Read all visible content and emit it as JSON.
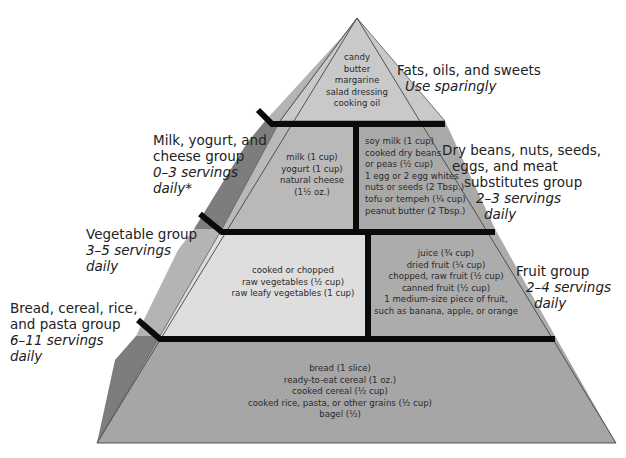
{
  "colors": {
    "top_face": "#c9c9c9",
    "milk_face": "#b9b9b9",
    "meat_face": "#a9a9a9",
    "veg_face": "#dedede",
    "fruit_face": "#acacac",
    "bread_face": "#a6a6a6",
    "side_dark": "#7d7d7d",
    "side_light": "#b4b4b4",
    "divider": "#0a0a0a"
  },
  "tiers": {
    "fats": {
      "label": "Fats, oils, and sweets",
      "servings": "Use sparingly",
      "items": [
        "candy",
        "butter",
        "margarine",
        "salad dressing",
        "cooking oil"
      ]
    },
    "milk": {
      "label_lines": [
        "Milk, yogurt, and",
        "cheese group"
      ],
      "servings_lines": [
        "0–3 servings",
        "daily*"
      ],
      "items": [
        "milk (1 cup)",
        "yogurt (1 cup)",
        "natural cheese",
        "(1¹⁄₂ oz.)"
      ]
    },
    "meat": {
      "label_lines": [
        "Dry beans, nuts, seeds,",
        "eggs, and meat",
        "substitutes group"
      ],
      "servings_lines": [
        "2–3 servings",
        "daily"
      ],
      "items": [
        "soy milk (1 cup)",
        "cooked dry beans",
        "or peas (¹⁄₂ cup)",
        "1 egg or 2 egg whites",
        "nuts or seeds (2 Tbsp.)",
        "tofu or tempeh (¹⁄₄ cup)",
        "peanut butter (2 Tbsp.)"
      ]
    },
    "vegetable": {
      "label": "Vegetable group",
      "servings_lines": [
        "3–5 servings",
        "daily"
      ],
      "items": [
        "cooked or chopped",
        "raw vegetables (¹⁄₂ cup)",
        "raw leafy vegetables (1 cup)"
      ]
    },
    "fruit": {
      "label": "Fruit group",
      "servings_lines": [
        "2–4 servings",
        "daily"
      ],
      "items": [
        "juice (³⁄₄ cup)",
        "dried fruit (¹⁄₄ cup)",
        "chopped, raw fruit (¹⁄₂ cup)",
        "canned fruit (¹⁄₂ cup)",
        "1 medium-size piece of fruit,",
        "such as banana, apple, or orange"
      ]
    },
    "bread": {
      "label_lines": [
        "Bread, cereal, rice,",
        "and pasta group"
      ],
      "servings_lines": [
        "6–11 servings",
        "daily"
      ],
      "items": [
        "bread (1 slice)",
        "ready-to-eat cereal (1 oz.)",
        "cooked cereal (¹⁄₂ cup)",
        "cooked rice, pasta, or other grains (¹⁄₂ cup)",
        "bagel (¹⁄₂)"
      ]
    }
  }
}
